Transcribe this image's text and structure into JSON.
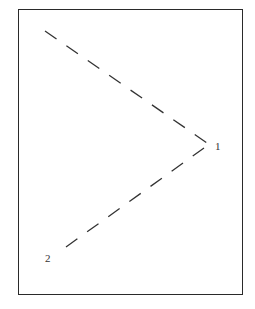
{
  "diagram": {
    "type": "dashed-line angle diagram",
    "frame": {
      "x": 18,
      "y": 9,
      "width": 225,
      "height": 286
    },
    "stroke_color": "#333333",
    "points": [
      {
        "id": "1",
        "label": "1",
        "x": 211,
        "y": 147,
        "label_x": 215,
        "label_y": 141
      },
      {
        "id": "2",
        "label": "2",
        "x": 65,
        "y": 248,
        "label_x": 45,
        "label_y": 253
      }
    ],
    "lines": [
      {
        "name": "upper-dashed-line",
        "x1": 45,
        "y1": 31,
        "x2": 210,
        "y2": 145,
        "dash": "14,12"
      },
      {
        "name": "lower-dashed-line",
        "x1": 66,
        "y1": 247,
        "x2": 204,
        "y2": 148,
        "dash": "14,12"
      }
    ]
  }
}
